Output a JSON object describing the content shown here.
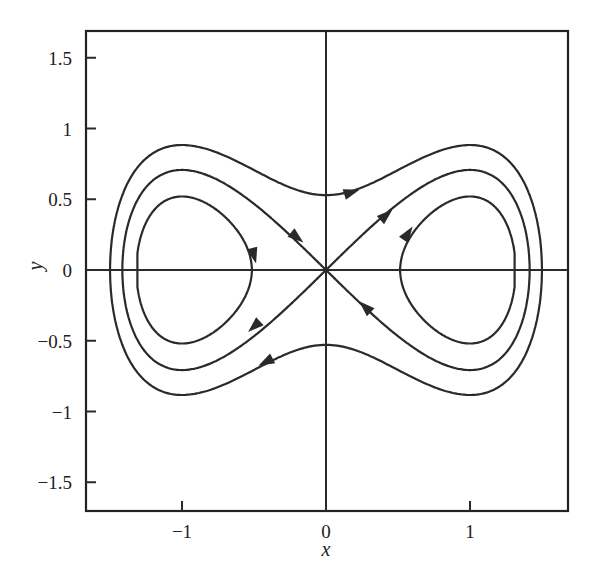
{
  "chart_data": {
    "type": "line",
    "title": "",
    "subtitle": "Phase portrait of x'' = x - x^3 (H = y^2/2 - x^2/2 + x^4/4)",
    "xlabel": "x",
    "ylabel": "y",
    "xlim": [
      -1.75,
      1.7
    ],
    "ylim": [
      -1.7,
      1.7
    ],
    "xticks": [
      -1,
      0,
      1
    ],
    "xtick_labels": [
      "−1",
      "0",
      "1"
    ],
    "yticks": [
      -1.5,
      -1,
      -0.5,
      0,
      0.5,
      1,
      1.5
    ],
    "ytick_labels": [
      "−1.5",
      "−1",
      "−0.5",
      "0",
      "0.5",
      "1",
      "1.5"
    ],
    "grid": false,
    "axes_lines_through_origin": true,
    "legend": null,
    "series": [
      {
        "name": "outer-orbit",
        "energy_H": 0.14,
        "x_extent": [
          -1.5,
          1.5
        ],
        "y_at_x0": [
          0.53,
          -0.53
        ],
        "y_max": 0.89
      },
      {
        "name": "separatrix",
        "energy_H": 0.0,
        "x_extent": [
          -1.414,
          1.414
        ],
        "through_origin": true,
        "y_max": 0.707
      },
      {
        "name": "inner-orbit-left",
        "energy_H": -0.115,
        "x_extent": [
          -1.31,
          -0.49
        ],
        "y_max": 0.53
      },
      {
        "name": "inner-orbit-right",
        "energy_H": -0.115,
        "x_extent": [
          0.49,
          1.31
        ],
        "y_max": 0.53
      }
    ],
    "arrows": [
      {
        "curve": "outer-orbit",
        "x": 0.18,
        "y": 0.55,
        "direction": "right"
      },
      {
        "curve": "outer-orbit",
        "x": -0.42,
        "y": -0.65,
        "direction": "left"
      },
      {
        "curve": "separatrix",
        "x": -0.2,
        "y": 0.23,
        "direction": "toward-origin"
      },
      {
        "curve": "separatrix",
        "x": 0.27,
        "y": -0.26,
        "direction": "toward-origin"
      },
      {
        "curve": "separatrix",
        "x": 0.42,
        "y": 0.39,
        "direction": "away-from-origin"
      },
      {
        "curve": "separatrix",
        "x": -0.5,
        "y": -0.4,
        "direction": "away-from-origin"
      },
      {
        "curve": "inner-orbit-left",
        "x": -0.5,
        "y": 0.1,
        "direction": "down"
      },
      {
        "curve": "inner-orbit-right",
        "x": 0.57,
        "y": 0.26,
        "direction": "up"
      }
    ]
  }
}
